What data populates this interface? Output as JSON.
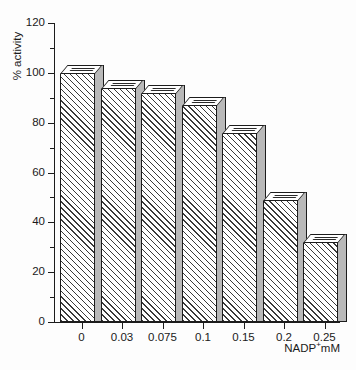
{
  "chart_data": {
    "type": "bar",
    "title": "",
    "xlabel": "NADP+mM",
    "xlabel_base": "NADP",
    "xlabel_sup": "+",
    "xlabel_unit": "mM",
    "ylabel": "% activity",
    "categories": [
      "0",
      "0.03",
      "0.075",
      "0.1",
      "0.15",
      "0.2",
      "0.25"
    ],
    "values": [
      100,
      94,
      92,
      87,
      76,
      49,
      32
    ],
    "ylim": [
      0,
      120
    ],
    "ytick_labels": [
      "0",
      "20",
      "40",
      "60",
      "80",
      "100",
      "120"
    ],
    "ytick_values": [
      0,
      20,
      40,
      60,
      80,
      100,
      120
    ],
    "yminor_values": [
      10,
      30,
      50,
      70,
      90,
      110
    ],
    "grid": false,
    "legend": null,
    "style": {
      "bar_face": "#ffffff",
      "bar_hatch": "#3a3a3a",
      "bar_side": "#b9b9b9",
      "outline": "#1c1c1c",
      "background": "#fdfdfd",
      "three_d": true
    }
  }
}
